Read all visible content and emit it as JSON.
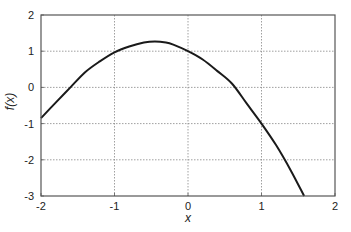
{
  "chart_data": {
    "type": "line",
    "title": "",
    "xlabel": "x",
    "ylabel": "f(x)",
    "xlim": [
      -2,
      2
    ],
    "ylim": [
      -3,
      2
    ],
    "grid": true,
    "legend": null,
    "x_ticks": [
      -2,
      -1,
      0,
      1,
      2
    ],
    "y_ticks": [
      -3,
      -2,
      -1,
      0,
      1,
      2
    ],
    "x_tick_labels": [
      "-2",
      "-1",
      "0",
      "1",
      "2"
    ],
    "y_tick_labels": [
      "-3",
      "-2",
      "-1",
      "0",
      "1",
      "2"
    ],
    "series": [
      {
        "name": "f(x)",
        "color": "#1a1a1a",
        "x": [
          -2.0,
          -1.8,
          -1.6,
          -1.4,
          -1.2,
          -1.0,
          -0.8,
          -0.6,
          -0.45,
          -0.3,
          -0.2,
          0.0,
          0.2,
          0.4,
          0.6,
          0.8,
          1.0,
          1.2,
          1.4,
          1.58
        ],
        "y": [
          -0.85,
          -0.42,
          0.0,
          0.42,
          0.72,
          0.97,
          1.13,
          1.24,
          1.27,
          1.24,
          1.18,
          1.0,
          0.77,
          0.45,
          0.1,
          -0.45,
          -1.0,
          -1.6,
          -2.3,
          -3.0
        ]
      }
    ]
  },
  "colors": {
    "line": "#1a1a1a",
    "axes": "#555555",
    "grid": "#888888",
    "text": "#222222",
    "background": "#ffffff"
  }
}
